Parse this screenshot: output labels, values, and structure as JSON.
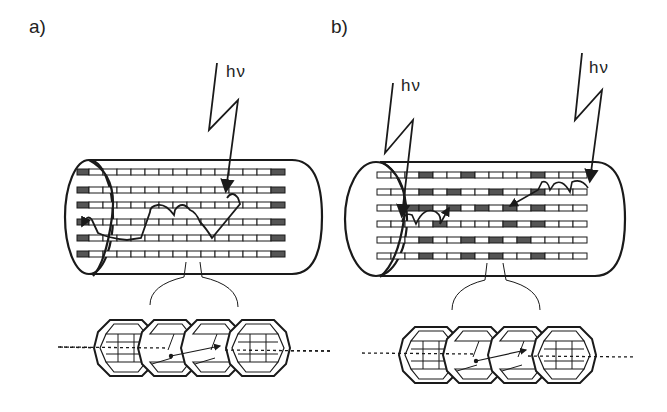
{
  "figure": {
    "panels": [
      {
        "label": "a)",
        "photon_labels": [
          "hν"
        ],
        "description": "Cylindrical channel with 6 rows of dye molecules; dark acceptor segments only at both ends; energy migrates across rows after single photon absorption",
        "cage_count": 4
      },
      {
        "label": "b)",
        "photon_labels": [
          "hν",
          "hν"
        ],
        "description": "Cylindrical channel with 6 rows of molecules; dark acceptor segments scattered throughout; two photon absorption events with short energy transfer paths",
        "cage_count": 4
      }
    ]
  },
  "colors": {
    "line": "#1a1a1a",
    "dark_segment": "#555555",
    "background": "#ffffff"
  }
}
